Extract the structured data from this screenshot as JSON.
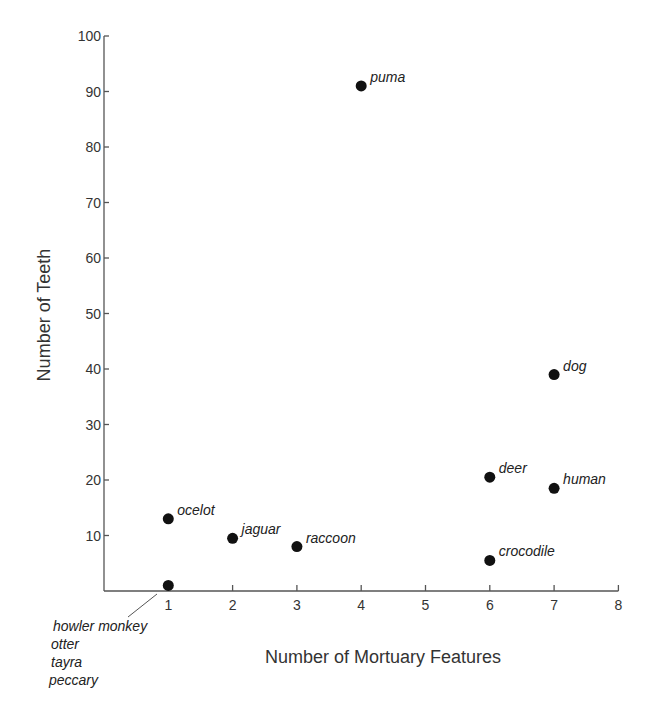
{
  "chart_data": {
    "type": "scatter",
    "title": "",
    "xlabel": "Number of Mortuary Features",
    "ylabel": "Number of Teeth",
    "xlim": [
      0,
      8
    ],
    "ylim": [
      0,
      100
    ],
    "x_ticks": [
      1,
      2,
      3,
      4,
      5,
      6,
      7,
      8
    ],
    "y_ticks": [
      10,
      20,
      30,
      40,
      50,
      60,
      70,
      80,
      90,
      100
    ],
    "grid": false,
    "legend": null,
    "points": [
      {
        "label": "puma",
        "x": 4,
        "y": 91
      },
      {
        "label": "dog",
        "x": 7,
        "y": 39
      },
      {
        "label": "deer",
        "x": 6,
        "y": 20.5
      },
      {
        "label": "human",
        "x": 7,
        "y": 18.5
      },
      {
        "label": "ocelot",
        "x": 1,
        "y": 13
      },
      {
        "label": "jaguar",
        "x": 2,
        "y": 9.5
      },
      {
        "label": "raccoon",
        "x": 3,
        "y": 8
      },
      {
        "label": "crocodile",
        "x": 6,
        "y": 5.5
      },
      {
        "label": "howler monkey, otter, tayra, peccary",
        "x": 1,
        "y": 1
      }
    ],
    "annotations": [
      {
        "text": "howler monkey",
        "attached_to_point_index": 8
      },
      {
        "text": "otter",
        "attached_to_point_index": 8
      },
      {
        "text": "tayra",
        "attached_to_point_index": 8
      },
      {
        "text": "peccary",
        "attached_to_point_index": 8
      }
    ]
  },
  "marker_color": "#111111",
  "axis_color": "#555555"
}
